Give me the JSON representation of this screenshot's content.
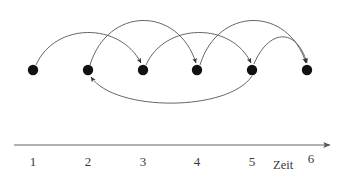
{
  "figure": {
    "background_color": "#ffffff",
    "width": 347,
    "height": 183
  },
  "axis": {
    "name_label": "Zeit",
    "line_color": "#555555",
    "arrow_direction": "right",
    "ticks": [
      {
        "label": "1",
        "x": 33
      },
      {
        "label": "2",
        "x": 88
      },
      {
        "label": "3",
        "x": 143
      },
      {
        "label": "4",
        "x": 197
      },
      {
        "label": "5",
        "x": 252
      },
      {
        "label": "6",
        "x": 307
      }
    ]
  },
  "nodes": [
    {
      "id": "node-1",
      "label": "1",
      "x": 33,
      "y": 70,
      "radius": 5.2,
      "color": "#111111"
    },
    {
      "id": "node-2",
      "label": "2",
      "x": 88,
      "y": 70,
      "radius": 5.2,
      "color": "#111111"
    },
    {
      "id": "node-3",
      "label": "3",
      "x": 143,
      "y": 70,
      "radius": 5.2,
      "color": "#111111"
    },
    {
      "id": "node-4",
      "label": "4",
      "x": 197,
      "y": 70,
      "radius": 5.2,
      "color": "#111111"
    },
    {
      "id": "node-5",
      "label": "5",
      "x": 252,
      "y": 70,
      "radius": 5.2,
      "color": "#111111"
    },
    {
      "id": "node-6",
      "label": "6",
      "x": 307,
      "y": 70,
      "radius": 5.2,
      "color": "#111111"
    }
  ],
  "edges": [
    {
      "id": "edge-1-3",
      "from": "1",
      "to": "3",
      "side": "above",
      "path": "M 36,65 C 55,22 120,22 141,63",
      "color": "#555555"
    },
    {
      "id": "edge-2-4",
      "from": "2",
      "to": "4",
      "side": "above",
      "path": "M 90,65 C 108,6 178,6 196,63",
      "color": "#555555"
    },
    {
      "id": "edge-3-5",
      "from": "3",
      "to": "5",
      "side": "above",
      "path": "M 146,65 C 165,22 232,22 251,63",
      "color": "#555555"
    },
    {
      "id": "edge-4-6",
      "from": "4",
      "to": "6",
      "side": "above",
      "path": "M 200,65 C 218,6 288,6 306,63",
      "color": "#555555"
    },
    {
      "id": "edge-5-6",
      "from": "5",
      "to": "6",
      "side": "above",
      "path": "M 254,64 C 268,30 296,26 307,63",
      "color": "#555555"
    },
    {
      "id": "edge-5-2",
      "from": "5",
      "to": "2",
      "side": "below",
      "path": "M 252,76 C 228,112 115,112 91,77",
      "color": "#555555"
    }
  ],
  "legend": {
    "description": "Sechs Ereignisse auf einer Zeitachse, verbunden durch gerichtete Bogenkanten"
  }
}
